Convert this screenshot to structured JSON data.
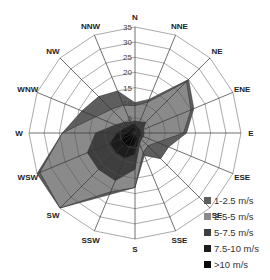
{
  "chart_data": {
    "type": "radar-stacked",
    "title": "",
    "directions": [
      "N",
      "NNE",
      "NE",
      "ENE",
      "E",
      "ESE",
      "SE",
      "SSE",
      "S",
      "SSW",
      "SW",
      "WSW",
      "W",
      "WNW",
      "NW",
      "NNW"
    ],
    "radial_ticks": [
      5,
      10,
      15,
      20,
      25,
      30,
      35
    ],
    "rmax": 35,
    "series": [
      {
        "name": "1-2.5 m/s",
        "color": "#5e5e5e",
        "cumulative": [
          10,
          12,
          25,
          21,
          17,
          12,
          12,
          8,
          18,
          22,
          35,
          35,
          24,
          19,
          17,
          15
        ]
      },
      {
        "name": "2.5-5 m/s",
        "color": "#8a8a8a",
        "cumulative": [
          9,
          11,
          24,
          20,
          16,
          8,
          6,
          7,
          18,
          21,
          35,
          34,
          24,
          14,
          11,
          10
        ]
      },
      {
        "name": "5-7.5 m/s",
        "color": "#3e3e3e",
        "cumulative": [
          4,
          4,
          5,
          3,
          3,
          3,
          3,
          4,
          12,
          17,
          17,
          17,
          13,
          7,
          5,
          4
        ]
      },
      {
        "name": "7.5-10 m/s",
        "color": "#1c1c1c",
        "cumulative": [
          3,
          2,
          2,
          2,
          2,
          2,
          2,
          3,
          7,
          9,
          9,
          9,
          6,
          4,
          3,
          3
        ]
      },
      {
        "name": ">10 m/s",
        "color": "#0a0a0a",
        "cumulative": [
          2,
          1,
          1,
          1,
          1,
          1,
          1,
          2,
          4,
          5,
          6,
          5,
          3,
          2,
          2,
          2
        ]
      }
    ],
    "legend_position": "bottom-right"
  },
  "legend": [
    {
      "label": "1-2.5 m/s",
      "color": "#5e5e5e"
    },
    {
      "label": "2.5-5 m/s",
      "color": "#8a8a8a"
    },
    {
      "label": "5-7.5 m/s",
      "color": "#3e3e3e"
    },
    {
      "label": "7.5-10 m/s",
      "color": "#1c1c1c"
    },
    {
      "label": ">10 m/s",
      "color": "#0a0a0a"
    }
  ]
}
